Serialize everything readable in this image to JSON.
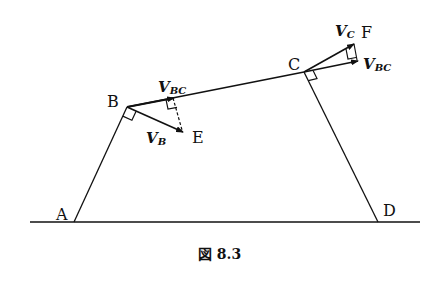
{
  "figure": {
    "caption": "図 8.3",
    "points": {
      "A": {
        "label": "A",
        "x": 74,
        "y": 222
      },
      "B": {
        "label": "B",
        "x": 127,
        "y": 107
      },
      "C": {
        "label": "C",
        "x": 304,
        "y": 72
      },
      "D": {
        "label": "D",
        "x": 378,
        "y": 222
      },
      "E": {
        "label": "E",
        "x": 183,
        "y": 132
      },
      "F": {
        "label": "F",
        "x": 356,
        "y": 44
      }
    },
    "vectors": {
      "VB": {
        "main": "V",
        "sub": "B"
      },
      "VBC_at_B": {
        "main": "V",
        "sub": "BC"
      },
      "VC": {
        "main": "V",
        "sub": "C"
      },
      "VBC_at_C": {
        "main": "V",
        "sub": "BC"
      }
    },
    "ground": {
      "x1": 30,
      "x2": 420,
      "y": 222
    }
  }
}
